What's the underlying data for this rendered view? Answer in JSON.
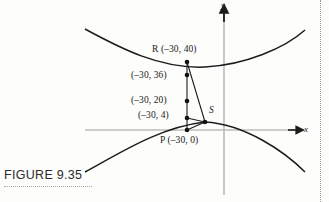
{
  "figure": {
    "caption": "FIGURE 9.35",
    "axes": {
      "x_label": "x",
      "y_label": "y",
      "x_axis_color": "#b9b9b9",
      "y_axis_color": "#b9b9b9",
      "arrow_color": "#1c1c1c"
    },
    "curve_color": "#1c1c1c",
    "segment_color": "#1c1c1c",
    "point_color": "#111111",
    "labels": [
      {
        "name": "point-R-label",
        "text": "R (–30, 40)",
        "x": 152,
        "y": 49
      },
      {
        "name": "point-36-label",
        "text": "(–30, 36)",
        "x": 131,
        "y": 75
      },
      {
        "name": "point-20-label",
        "text": "(–30, 20)",
        "x": 131,
        "y": 97
      },
      {
        "name": "point-4-label",
        "text": "(–30, 4)",
        "x": 138,
        "y": 113
      },
      {
        "name": "point-S-label",
        "text": "S",
        "x": 208,
        "y": 110
      },
      {
        "name": "point-P-label",
        "text": "P (–30, 0)",
        "x": 162,
        "y": 139
      }
    ],
    "points": [
      {
        "name": "point-R",
        "label": "R",
        "coords": [
          -30,
          40
        ],
        "px": 187,
        "py": 62
      },
      {
        "name": "point-minus30-36",
        "label": "(–30, 36)",
        "coords": [
          -30,
          36
        ],
        "px": 187,
        "py": 75
      },
      {
        "name": "point-minus30-20",
        "label": "(–30, 20)",
        "coords": [
          -30,
          20
        ],
        "px": 187,
        "py": 101
      },
      {
        "name": "point-minus30-4",
        "label": "(–30, 4)",
        "coords": [
          -30,
          4
        ],
        "px": 187,
        "py": 118
      },
      {
        "name": "point-P",
        "label": "P",
        "coords": [
          -30,
          0
        ],
        "px": 187,
        "py": 130
      },
      {
        "name": "point-S",
        "label": "S",
        "coords": null,
        "px": 205,
        "py": 122
      }
    ],
    "segments": [
      {
        "name": "segment-R-to-P",
        "from": "point-R",
        "to": "point-P"
      },
      {
        "name": "segment-R-to-S",
        "from": "point-R",
        "to": "point-S"
      },
      {
        "name": "segment-P-to-S",
        "from": "point-P",
        "to": "point-S"
      },
      {
        "name": "segment-S-to-4",
        "from": "point-S",
        "to": "point-minus30-4"
      }
    ],
    "curves": {
      "upper_branch": "M 85,29 C 120,48 160,69 205,67 C 245,65 285,48 305,30",
      "lower_branch": "M 85,172 C 120,153 160,127 205,122 C 245,124 285,152 305,172"
    }
  }
}
